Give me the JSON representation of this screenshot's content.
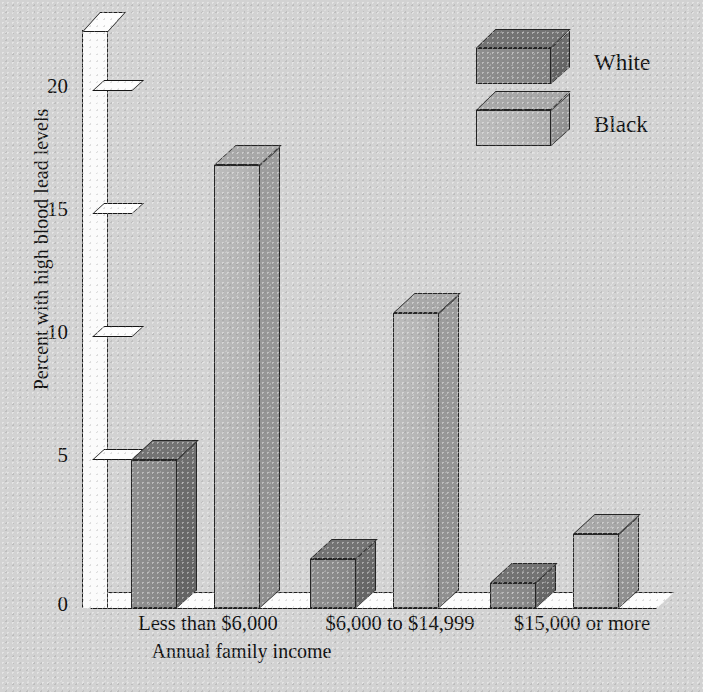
{
  "chart_data": {
    "type": "bar",
    "title": "",
    "subtitle": "",
    "xlabel": "Annual family income",
    "ylabel": "Percent with high blood lead levels",
    "categories": [
      "Less than $6,000",
      "$6,000 to $14,999",
      "$15,000 or more"
    ],
    "series": [
      {
        "name": "White",
        "values": [
          6,
          2,
          1
        ],
        "color": "#8a8a8a"
      },
      {
        "name": "Black",
        "values": [
          18,
          12,
          3
        ],
        "color": "#b6b6b6"
      }
    ],
    "ylim": [
      0,
      22
    ],
    "yticks": [
      0,
      5,
      10,
      15,
      20
    ],
    "ytick_labels": [
      "0",
      "5",
      "10",
      "15",
      "20"
    ],
    "grid": false,
    "legend_position": "top-right",
    "style": "3d-perspective-bars",
    "annotations": []
  },
  "axes": {
    "y": {
      "label": "Percent with high blood lead levels",
      "ticks": [
        "20",
        "15",
        "10",
        "5",
        "0"
      ]
    },
    "x": {
      "label": "Annual family income",
      "categories": [
        "Less than $6,000",
        "$6,000 to $14,999",
        "$15,000 or more"
      ]
    }
  },
  "legend": {
    "items": [
      {
        "label": "White"
      },
      {
        "label": "Black"
      }
    ]
  },
  "colors": {
    "background": "#d2d2d2",
    "white_series_front": "#8a8a8a",
    "white_series_side": "#6b6b6b",
    "black_series_front": "#b6b6b6",
    "black_series_side": "#969696",
    "axis_face": "#fbfbfb",
    "outline": "#1d1d1d"
  }
}
